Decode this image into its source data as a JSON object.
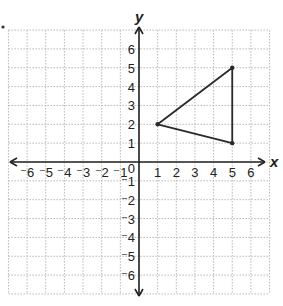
{
  "chart_data": {
    "type": "scatter",
    "title": "",
    "xlabel": "x",
    "ylabel": "y",
    "xlim": [
      -7,
      7
    ],
    "ylim": [
      -7,
      7
    ],
    "grid": true,
    "x_ticks": [
      -6,
      -5,
      -4,
      -3,
      -2,
      -1,
      0,
      1,
      2,
      3,
      4,
      5,
      6
    ],
    "y_ticks": [
      -6,
      -5,
      -4,
      -3,
      -2,
      -1,
      1,
      2,
      3,
      4,
      5,
      6
    ],
    "origin_label": "0",
    "series": [
      {
        "name": "triangle",
        "shape": "polygon",
        "points": [
          [
            1,
            2
          ],
          [
            5,
            5
          ],
          [
            5,
            1
          ]
        ]
      }
    ]
  },
  "colors": {
    "axis": "#222222",
    "grid": "#b8b8b8",
    "shape": "#2a2a2a",
    "background": "#ffffff"
  }
}
